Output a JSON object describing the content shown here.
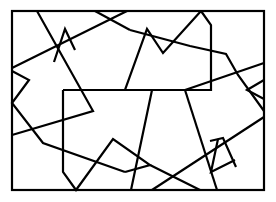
{
  "figure": {
    "stroke_color": "#000000",
    "background_color": "#ffffff",
    "frame": {
      "x": 12,
      "y": 11,
      "width": 252,
      "height": 179
    },
    "polylines": [
      {
        "id": "p1",
        "points": "37,11 93,111 12,135"
      },
      {
        "id": "p2",
        "points": "12,68 127,11"
      },
      {
        "id": "p3",
        "points": "54,62 65,29 75,50"
      },
      {
        "id": "p4",
        "points": "95,11 130,30"
      },
      {
        "id": "p5",
        "points": "130,30 190,46 226,54 238,75 264,111"
      },
      {
        "id": "p6",
        "points": "201,11 211,25 211,90 125,90 147,29 163,53 201,11"
      },
      {
        "id": "p7",
        "points": "12,71 29,80 12,103 43,143 125,172"
      },
      {
        "id": "p8",
        "points": "63,90 152,90 131,190"
      },
      {
        "id": "p9",
        "points": "63,90 63,172 76,190 113,139 150,165 125,172"
      },
      {
        "id": "p10",
        "points": "185,90 264,63"
      },
      {
        "id": "p11",
        "points": "185,90 217,190"
      },
      {
        "id": "p12",
        "points": "150,165 200,190"
      },
      {
        "id": "p13",
        "points": "152,190 264,117"
      },
      {
        "id": "p14",
        "points": "264,99 247,90 264,80"
      },
      {
        "id": "p15",
        "points": "218,139 211,172 235,160"
      },
      {
        "id": "p16",
        "points": "210,141 223,138 236,167"
      }
    ]
  }
}
